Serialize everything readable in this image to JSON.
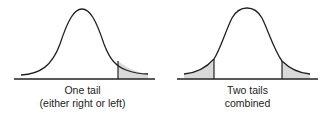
{
  "panels": [
    {
      "id": "one-tail",
      "caption_line1": "One tail",
      "caption_line2": "(either right or left)",
      "shaded_regions": [
        "right"
      ]
    },
    {
      "id": "two-tails",
      "caption_line1": "Two tails",
      "caption_line2": "combined",
      "shaded_regions": [
        "left",
        "right"
      ]
    }
  ],
  "colors": {
    "curve": "#222222",
    "shade": "#d9d9d9",
    "baseline": "#222222"
  }
}
